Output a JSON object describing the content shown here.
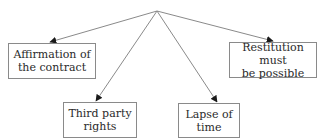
{
  "diagram": {
    "type": "tree",
    "root": {
      "label": "",
      "x": 157,
      "y": 11
    },
    "nodes": [
      {
        "id": "affirmation",
        "lines": [
          "Affirmation of",
          "the contract"
        ],
        "x": 8,
        "y": 43,
        "w": 88,
        "h": 36
      },
      {
        "id": "restitution",
        "lines": [
          "Restitution must",
          "be possible"
        ],
        "x": 229,
        "y": 42,
        "w": 88,
        "h": 36
      },
      {
        "id": "third-party",
        "lines": [
          "Third party",
          "rights"
        ],
        "x": 63,
        "y": 102,
        "w": 74,
        "h": 36
      },
      {
        "id": "lapse",
        "lines": [
          "Lapse of",
          "time"
        ],
        "x": 178,
        "y": 103,
        "w": 62,
        "h": 35
      }
    ],
    "edges": [
      {
        "from": "root",
        "to": "affirmation"
      },
      {
        "from": "root",
        "to": "restitution"
      },
      {
        "from": "root",
        "to": "third-party"
      },
      {
        "from": "root",
        "to": "lapse"
      }
    ],
    "colors": {
      "line": "#8a8a8a",
      "arrowhead": "#1a1a1a",
      "border": "#8a8a8a",
      "text": "#2a2a2a"
    }
  }
}
